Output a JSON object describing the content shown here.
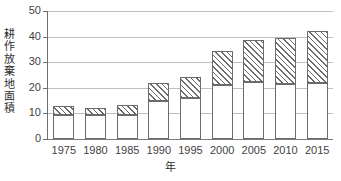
{
  "chart_data": {
    "type": "bar",
    "title": "",
    "subtitle": "",
    "xlabel": "年",
    "ylabel": "耕作放棄地面積",
    "ylim": [
      0,
      50
    ],
    "ytick_values": [
      0,
      10,
      20,
      30,
      40,
      50
    ],
    "ytick_labels": [
      "0",
      "10",
      "20",
      "30",
      "40",
      "50"
    ],
    "grid": true,
    "legend": "none",
    "stacked": true,
    "categories": [
      "1975",
      "1980",
      "1985",
      "1990",
      "1995",
      "2000",
      "2005",
      "2010",
      "2015"
    ],
    "series": [
      {
        "name": "lower-white-segment",
        "fill": "white",
        "values": [
          9.5,
          9.5,
          9.5,
          15.0,
          16.0,
          21.0,
          22.3,
          21.3,
          22.0
        ]
      },
      {
        "name": "upper-hatched-segment",
        "fill": "diagonal-hatch",
        "values": [
          3.5,
          2.8,
          3.6,
          6.7,
          8.4,
          13.3,
          16.2,
          18.3,
          20.3
        ]
      }
    ],
    "totals": [
      13.0,
      12.3,
      13.1,
      21.7,
      24.4,
      34.3,
      38.5,
      39.6,
      42.3
    ],
    "colors": {
      "axis": "#6e6e6e",
      "grid": "#bfbfbf",
      "bar_outline": "#6b6b6b",
      "bar_lower_fill": "#ffffff",
      "bar_hatch": "#6b6b6b",
      "text": "#3f3f3f",
      "background": "#ffffff"
    }
  }
}
